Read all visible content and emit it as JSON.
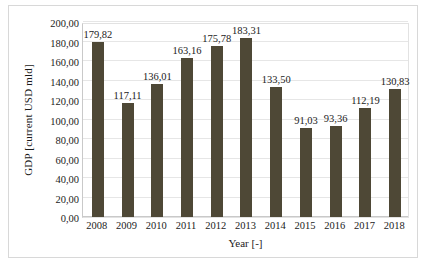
{
  "chart_data": {
    "type": "bar",
    "title": "",
    "xlabel": "Year [-]",
    "ylabel": "GDP [current USD mld]",
    "categories": [
      "2008",
      "2009",
      "2010",
      "2011",
      "2012",
      "2013",
      "2014",
      "2015",
      "2016",
      "2017",
      "2018"
    ],
    "values": [
      179.82,
      117.11,
      136.01,
      163.16,
      175.78,
      183.31,
      133.5,
      91.03,
      93.36,
      112.19,
      130.83
    ],
    "value_labels": [
      "179,82",
      "117,11",
      "136,01",
      "163,16",
      "175,78",
      "183,31",
      "133,50",
      "91,03",
      "93,36",
      "112,19",
      "130,83"
    ],
    "ylim": [
      0,
      200
    ],
    "ytick_values": [
      0,
      20,
      40,
      60,
      80,
      100,
      120,
      140,
      160,
      180,
      200
    ],
    "ytick_labels": [
      "0,00",
      "20,00",
      "40,00",
      "60,00",
      "80,00",
      "100,00",
      "120,00",
      "140,00",
      "160,00",
      "180,00",
      "200,00"
    ],
    "grid": true,
    "legend": false,
    "series_color": "#4e4836",
    "text_color": "#1b1b1b",
    "grid_color": "#e6e6e6"
  }
}
